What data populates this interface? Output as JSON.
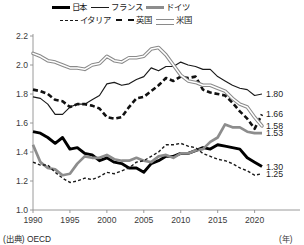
{
  "chart_data": {
    "type": "line",
    "title": "",
    "xlabel": "",
    "ylabel": "",
    "unit_note": "(年)",
    "source": "(出典) OECD",
    "xlim": [
      1990,
      2021
    ],
    "ylim": [
      1.0,
      2.2
    ],
    "grid": false,
    "legend_position": "top",
    "yticks": [
      "2.2",
      "2.0",
      "1.8",
      "1.6",
      "1.4",
      "1.2",
      "1.0"
    ],
    "ytick_values": [
      2.2,
      2.0,
      1.8,
      1.6,
      1.4,
      1.2,
      1.0
    ],
    "xticks": [
      "1990",
      "1995",
      "2000",
      "2005",
      "2010",
      "2015",
      "2020"
    ],
    "xtick_values": [
      1990,
      1995,
      2000,
      2005,
      2010,
      2015,
      2020
    ],
    "x": [
      1990,
      1991,
      1992,
      1993,
      1994,
      1995,
      1996,
      1997,
      1998,
      1999,
      2000,
      2001,
      2002,
      2003,
      2004,
      2005,
      2006,
      2007,
      2008,
      2009,
      2010,
      2011,
      2012,
      2013,
      2014,
      2015,
      2016,
      2017,
      2018,
      2019,
      2020,
      2021
    ],
    "series": [
      {
        "name": "日本",
        "name_en": "Japan",
        "style": "solid-thick-black",
        "color": "#000000",
        "end_label": "1.30",
        "end_value": 1.3,
        "values": [
          1.54,
          1.53,
          1.5,
          1.46,
          1.5,
          1.42,
          1.43,
          1.39,
          1.38,
          1.34,
          1.36,
          1.33,
          1.32,
          1.29,
          1.29,
          1.26,
          1.32,
          1.34,
          1.37,
          1.37,
          1.39,
          1.39,
          1.41,
          1.43,
          1.42,
          1.45,
          1.44,
          1.43,
          1.42,
          1.36,
          1.33,
          1.3
        ]
      },
      {
        "name": "フランス",
        "name_en": "France",
        "style": "solid-thin-black",
        "color": "#1a1a1a",
        "end_label": "1.80",
        "end_value": 1.8,
        "values": [
          1.78,
          1.77,
          1.73,
          1.66,
          1.66,
          1.71,
          1.73,
          1.73,
          1.76,
          1.79,
          1.87,
          1.88,
          1.86,
          1.87,
          1.9,
          1.92,
          1.98,
          1.96,
          1.99,
          1.99,
          2.02,
          2.0,
          1.99,
          1.97,
          1.97,
          1.92,
          1.89,
          1.86,
          1.84,
          1.83,
          1.79,
          1.8
        ]
      },
      {
        "name": "ドイツ",
        "name_en": "Germany",
        "style": "solid-thick-grey",
        "color": "#8d8d8d",
        "end_label": "1.53",
        "end_value": 1.53,
        "values": [
          1.45,
          1.33,
          1.29,
          1.28,
          1.24,
          1.25,
          1.32,
          1.37,
          1.36,
          1.36,
          1.38,
          1.35,
          1.34,
          1.34,
          1.36,
          1.34,
          1.33,
          1.37,
          1.38,
          1.36,
          1.39,
          1.39,
          1.41,
          1.42,
          1.47,
          1.5,
          1.59,
          1.57,
          1.57,
          1.54,
          1.53,
          1.53
        ]
      },
      {
        "name": "イタリア",
        "name_en": "Italy",
        "style": "dotted-fine-black",
        "color": "#1a1a1a",
        "end_label": "1.25",
        "end_value": 1.25,
        "values": [
          1.33,
          1.31,
          1.31,
          1.26,
          1.22,
          1.19,
          1.2,
          1.22,
          1.21,
          1.23,
          1.26,
          1.25,
          1.27,
          1.29,
          1.33,
          1.34,
          1.37,
          1.4,
          1.45,
          1.45,
          1.46,
          1.44,
          1.43,
          1.39,
          1.37,
          1.35,
          1.34,
          1.32,
          1.29,
          1.27,
          1.24,
          1.25
        ]
      },
      {
        "name": "英国",
        "name_en": "United Kingdom",
        "style": "dashed-bold-black",
        "color": "#111111",
        "end_label": "1.66",
        "end_value": 1.66,
        "values": [
          1.83,
          1.82,
          1.8,
          1.76,
          1.75,
          1.71,
          1.73,
          1.73,
          1.72,
          1.7,
          1.64,
          1.63,
          1.64,
          1.71,
          1.77,
          1.78,
          1.82,
          1.86,
          1.91,
          1.89,
          1.92,
          1.91,
          1.92,
          1.83,
          1.81,
          1.8,
          1.79,
          1.74,
          1.68,
          1.63,
          1.56,
          1.66
        ]
      },
      {
        "name": "米国",
        "name_en": "United States",
        "style": "double-outline-grey",
        "color": "#8a8a8a",
        "end_label": "1.58",
        "end_value": 1.58,
        "values": [
          2.08,
          2.06,
          2.03,
          2.02,
          2.0,
          1.98,
          1.98,
          1.97,
          2.0,
          2.01,
          2.06,
          2.03,
          2.02,
          2.05,
          2.05,
          2.06,
          2.11,
          2.12,
          2.07,
          2.0,
          1.93,
          1.89,
          1.88,
          1.86,
          1.86,
          1.84,
          1.82,
          1.77,
          1.73,
          1.71,
          1.64,
          1.58
        ]
      }
    ]
  },
  "legend": {
    "rows": [
      [
        {
          "label": "日本",
          "swatch": "sw-japan"
        },
        {
          "label": "フランス",
          "swatch": "sw-france"
        },
        {
          "label": "ドイツ",
          "swatch": "sw-germany"
        }
      ],
      [
        {
          "label": "イタリア",
          "swatch": "sw-italy"
        },
        {
          "label": "英国",
          "swatch": "sw-uk"
        },
        {
          "label": "米国",
          "swatch": "sw-usa"
        }
      ]
    ]
  },
  "footer": {
    "source": "(出典) OECD",
    "unit": "(年)"
  }
}
